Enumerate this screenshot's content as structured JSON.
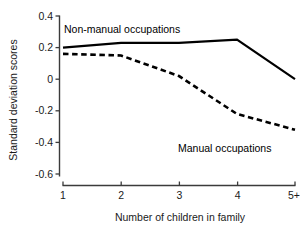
{
  "chart_data": {
    "type": "line",
    "title": "",
    "xlabel": "Number of children in family",
    "ylabel": "Standard deviation scores",
    "categories": [
      "1",
      "2",
      "3",
      "4",
      "5+"
    ],
    "x_tick_labels": [
      "1",
      "2",
      "3",
      "4",
      "5+"
    ],
    "y_tick_labels": [
      "0.4",
      "0.2",
      "0",
      "-0.2",
      "-0.4",
      "-0.6"
    ],
    "y_tick_values": [
      0.4,
      0.2,
      0,
      -0.2,
      -0.4,
      -0.6
    ],
    "ylim": [
      -0.6,
      0.4
    ],
    "grid": false,
    "legend_position": "inline-annotations",
    "series": [
      {
        "name": "Non-manual occupations",
        "style": "solid",
        "color": "#000000",
        "values": [
          0.2,
          0.23,
          0.23,
          0.25,
          0.0
        ]
      },
      {
        "name": "Manual occupations",
        "style": "dashed",
        "color": "#000000",
        "values": [
          0.16,
          0.15,
          0.02,
          -0.22,
          -0.32
        ]
      }
    ],
    "annotations": [
      {
        "text": "Non-manual occupations",
        "x": 1.25,
        "y": 0.325
      },
      {
        "text": "Manual occupations",
        "x": 3.15,
        "y": -0.4
      }
    ]
  },
  "axes": {
    "y_labels": {
      "t0": "0.4",
      "t1": "0.2",
      "t2": "0",
      "t3": "-0.2",
      "t4": "-0.4",
      "t5": "-0.6"
    },
    "x_labels": {
      "t0": "1",
      "t1": "2",
      "t2": "3",
      "t3": "4",
      "t4": "5+"
    },
    "x_title": "Number of children in family",
    "y_title": "Standard deviation scores"
  },
  "series_labels": {
    "non_manual": "Non-manual occupations",
    "manual": "Manual occupations"
  },
  "colors": {
    "line": "#000000",
    "axis": "#3b3b3b",
    "text": "#1a1a1a",
    "background": "#ffffff"
  }
}
